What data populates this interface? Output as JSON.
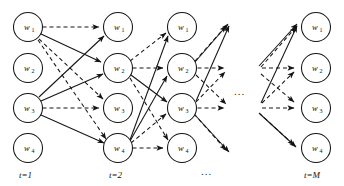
{
  "diagram": {
    "node_symbol": "w",
    "layers": [
      {
        "id": "layer-1",
        "label": "t=1",
        "cx": 28,
        "label_x": 28,
        "nodes": [
          {
            "label": "w",
            "sub": "1",
            "cy": 27
          },
          {
            "label": "w",
            "sub": "2",
            "cy": 68
          },
          {
            "label": "w",
            "sub": "3",
            "cy": 108
          },
          {
            "label": "w",
            "sub": "4",
            "cy": 148
          }
        ]
      },
      {
        "id": "layer-2",
        "label": "t=2",
        "cx": 118,
        "label_x": 118,
        "nodes": [
          {
            "label": "w",
            "sub": "1",
            "cy": 27
          },
          {
            "label": "w",
            "sub": "2",
            "cy": 68
          },
          {
            "label": "w",
            "sub": "3",
            "cy": 108
          },
          {
            "label": "w",
            "sub": "4",
            "cy": 148
          }
        ]
      },
      {
        "id": "layer-3",
        "label": "",
        "cx": 182,
        "label_x": 182,
        "nodes": [
          {
            "label": "w",
            "sub": "1",
            "cy": 27
          },
          {
            "label": "w",
            "sub": "2",
            "cy": 68
          },
          {
            "label": "w",
            "sub": "3",
            "cy": 108
          },
          {
            "label": "w",
            "sub": "4",
            "cy": 148
          }
        ]
      },
      {
        "id": "layer-M",
        "label": "t=M",
        "cx": 316,
        "label_x": 316,
        "nodes": [
          {
            "label": "w",
            "sub": "1",
            "cy": 27
          },
          {
            "label": "w",
            "sub": "2",
            "cy": 68
          },
          {
            "label": "w",
            "sub": "3",
            "cy": 108
          },
          {
            "label": "w",
            "sub": "4",
            "cy": 148
          }
        ]
      }
    ],
    "node_radius": 14.5,
    "ellipses": [
      {
        "id": "ellipsis-middle-upper",
        "x": 243,
        "y": 92,
        "text": "..."
      },
      {
        "id": "ellipsis-middle-lower",
        "x": 210,
        "y": 172,
        "text": "..."
      }
    ],
    "colors": {
      "stroke": "#141414",
      "node_fill": "#ffffff",
      "background": "#ffffff",
      "text": "#111111"
    },
    "edge_styles": {
      "solid": "solid",
      "dashed": "dashed"
    },
    "edges": [
      {
        "from": "L1.w1",
        "to": "L2.w1",
        "style": "dashed"
      },
      {
        "from": "L1.w1",
        "to": "L2.w2",
        "style": "solid"
      },
      {
        "from": "L1.w1",
        "to": "L2.w3",
        "style": "dashed"
      },
      {
        "from": "L1.w1",
        "to": "L2.w4",
        "style": "dashed"
      },
      {
        "from": "L1.w3",
        "to": "L2.w1",
        "style": "solid"
      },
      {
        "from": "L1.w3",
        "to": "L2.w2",
        "style": "solid"
      },
      {
        "from": "L1.w3",
        "to": "L2.w3",
        "style": "dashed"
      },
      {
        "from": "L1.w3",
        "to": "L2.w4",
        "style": "solid"
      },
      {
        "from": "L2.w2",
        "to": "L3.w1",
        "style": "dashed"
      },
      {
        "from": "L2.w2",
        "to": "L3.w2",
        "style": "dashed"
      },
      {
        "from": "L2.w2",
        "to": "L3.w3",
        "style": "solid"
      },
      {
        "from": "L2.w2",
        "to": "L3.w4",
        "style": "dashed"
      },
      {
        "from": "L2.w4",
        "to": "L3.w1",
        "style": "solid"
      },
      {
        "from": "L2.w4",
        "to": "L3.w2",
        "style": "solid"
      },
      {
        "from": "L2.w4",
        "to": "L3.w3",
        "style": "dashed"
      },
      {
        "from": "L2.w4",
        "to": "L3.w4",
        "style": "dashed"
      },
      {
        "from": "L3.w2",
        "to": "next.a",
        "style": "solid"
      },
      {
        "from": "L3.w2",
        "to": "next.b",
        "style": "dashed"
      },
      {
        "from": "L3.w2",
        "to": "next.c",
        "style": "solid"
      },
      {
        "from": "L3.w2",
        "to": "next.d",
        "style": "dashed"
      },
      {
        "from": "L3.w3",
        "to": "next.a",
        "style": "dashed"
      },
      {
        "from": "L3.w3",
        "to": "next.b",
        "style": "solid"
      },
      {
        "from": "L3.w3",
        "to": "next.c",
        "style": "dashed"
      },
      {
        "from": "L3.w3",
        "to": "next.d",
        "style": "solid"
      },
      {
        "from": "prev.a",
        "to": "LM.w1",
        "style": "solid"
      },
      {
        "from": "prev.a",
        "to": "LM.w2",
        "style": "dashed"
      },
      {
        "from": "prev.a",
        "to": "LM.w3",
        "style": "solid"
      },
      {
        "from": "prev.a",
        "to": "LM.w4",
        "style": "dashed"
      },
      {
        "from": "prev.b",
        "to": "LM.w1",
        "style": "dashed"
      },
      {
        "from": "prev.b",
        "to": "LM.w2",
        "style": "solid"
      },
      {
        "from": "prev.b",
        "to": "LM.w3",
        "style": "dashed"
      },
      {
        "from": "prev.b",
        "to": "LM.w4",
        "style": "solid"
      }
    ]
  }
}
